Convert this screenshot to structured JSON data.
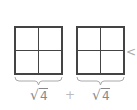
{
  "diagram": {
    "boxes": [
      {
        "name": "square-grid-left",
        "rows": 2,
        "cols": 2
      },
      {
        "name": "square-grid-right",
        "rows": 2,
        "cols": 2
      }
    ],
    "labels": [
      {
        "radical": "√",
        "radicand": "4"
      },
      {
        "radical": "√",
        "radicand": "4"
      }
    ],
    "operator": "+",
    "pointer": "<",
    "colors": {
      "grid_line": "#444444",
      "label_text": "#888888",
      "brace": "#aaaaaa",
      "operator": "#bbbbbb"
    }
  }
}
